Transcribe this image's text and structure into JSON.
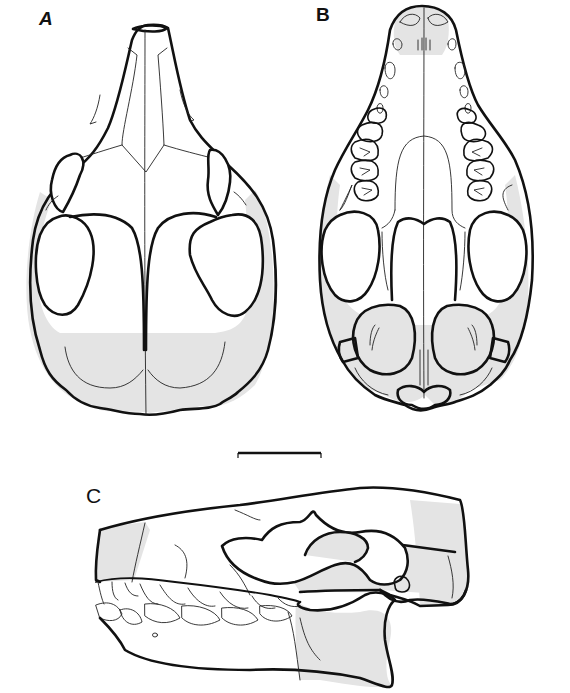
{
  "figure": {
    "panels": [
      {
        "id": "A",
        "label": "A",
        "view": "dorsal view of skull"
      },
      {
        "id": "B",
        "label": "B",
        "view": "ventral view of skull"
      },
      {
        "id": "C",
        "label": "C",
        "view": "lateral view of skull with mandible"
      }
    ],
    "scale_bar": {
      "label": ""
    },
    "colors": {
      "line": "#111111",
      "shading": "#e4e4e4",
      "background": "#ffffff"
    }
  }
}
